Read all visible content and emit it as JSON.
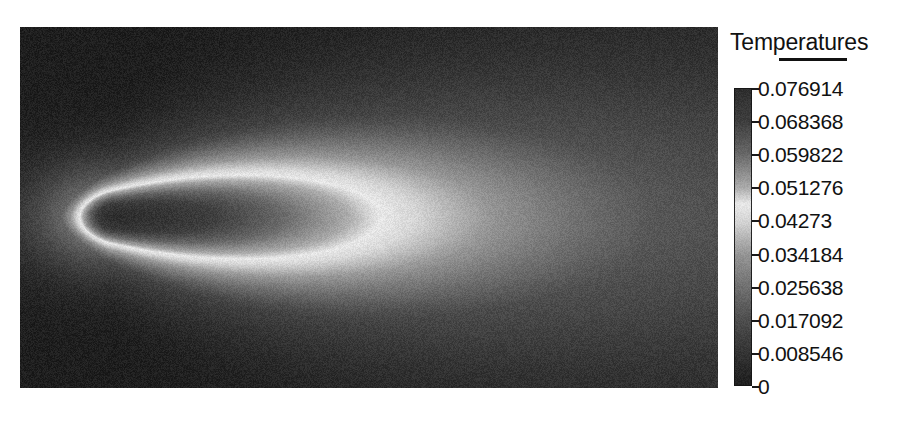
{
  "figure": {
    "kind": "contour-plot",
    "background_color": "#ffffff"
  },
  "legend": {
    "title": "Temperatures",
    "title_underline": true,
    "orientation": "vertical",
    "colormap_name": "grayscale-wraparound",
    "tick_labels": [
      "0.076914",
      "0.068368",
      "0.059822",
      "0.051276",
      "0.04273",
      "0.034184",
      "0.025638",
      "0.017092",
      "0.008546",
      "0"
    ]
  },
  "chart_data": {
    "type": "heatmap",
    "title": "Temperatures",
    "xlabel": "",
    "ylabel": "",
    "colorbar_label": "Temperatures",
    "grid": false,
    "legend_position": "right",
    "colorbar_ticks": [
      0.076914,
      0.068368,
      0.059822,
      0.051276,
      0.04273,
      0.034184,
      0.025638,
      0.017092,
      0.008546,
      0
    ],
    "tick_label_strings": [
      "0.076914",
      "0.068368",
      "0.059822",
      "0.051276",
      "0.04273",
      "0.034184",
      "0.025638",
      "0.017092",
      "0.008546",
      "0"
    ],
    "zlim": [
      0,
      0.076914
    ],
    "tick_interval": 0.008546,
    "n_levels": 10,
    "colormap": "grayscale wrap-around: dark at maximum, white near mid-range (~0.047), dark at zero",
    "colormap_stops": [
      {
        "value": 0.076914,
        "gray": 46
      },
      {
        "value": 0.068368,
        "gray": 62
      },
      {
        "value": 0.059822,
        "gray": 104
      },
      {
        "value": 0.051276,
        "gray": 170
      },
      {
        "value": 0.047,
        "gray": 232
      },
      {
        "value": 0.04273,
        "gray": 214
      },
      {
        "value": 0.034184,
        "gray": 150
      },
      {
        "value": 0.025638,
        "gray": 112
      },
      {
        "value": 0.017092,
        "gray": 78
      },
      {
        "value": 0.008546,
        "gray": 52
      },
      {
        "value": 0,
        "gray": 30
      }
    ],
    "field_description": "Axisymmetric laminar jet-flame / buoyant plume temperature field. A teardrop-shaped hot core is anchored near the left edge of the domain and a long warm tail extends to the right boundary.",
    "domain": {
      "x": [
        0,
        1
      ],
      "y": [
        0,
        1
      ],
      "units": "normalized"
    },
    "features": [
      {
        "name": "hot-core",
        "center_xy": [
          0.14,
          0.52
        ],
        "peak_value": 0.076914
      },
      {
        "name": "flame-front-ring",
        "value": 0.047,
        "appearance": "bright white closed contour wrapping the core"
      },
      {
        "name": "downstream-tail",
        "x_extent": [
          0.3,
          1.0
        ],
        "value_range": [
          0.02,
          0.05
        ]
      },
      {
        "name": "ambient-background",
        "value": 0.0,
        "appearance": "dark field filling the corners"
      }
    ]
  }
}
